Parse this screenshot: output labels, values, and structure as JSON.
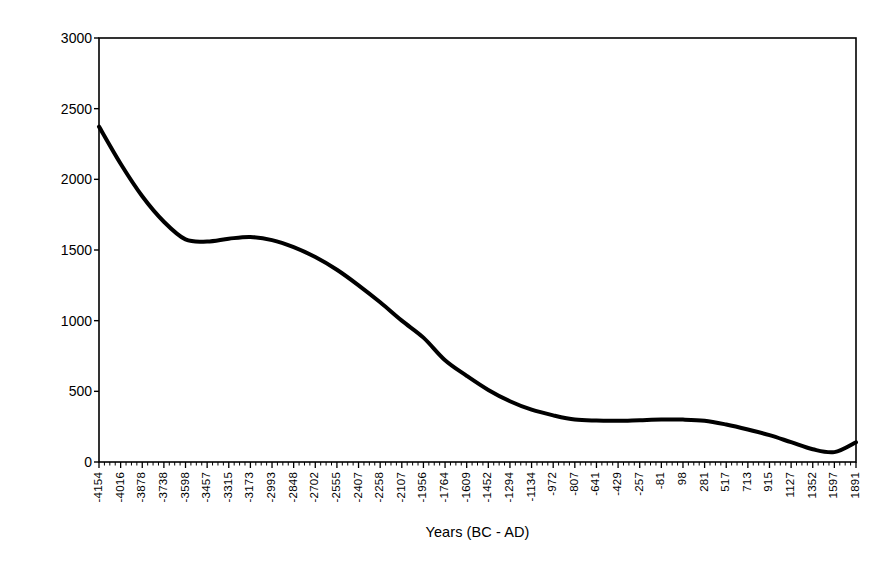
{
  "chart_data": {
    "type": "line",
    "title": "",
    "xlabel": "Years (BC - AD)",
    "ylabel": "Plantago Pollen Count",
    "ylim": [
      0,
      3000
    ],
    "ytick_labels": [
      "0",
      "500",
      "1000",
      "1500",
      "2000",
      "2500",
      "3000"
    ],
    "ytick_values": [
      0,
      500,
      1000,
      1500,
      2000,
      2500,
      3000
    ],
    "grid": false,
    "legend": "none",
    "frame": "full-box",
    "line_color": "#000000",
    "line_width": 4,
    "x_tick_labels": [
      "-4154",
      "-4016",
      "-3878",
      "-3738",
      "-3598",
      "-3457",
      "-3315",
      "-3173",
      "-2993",
      "-2848",
      "-2702",
      "-2555",
      "-2407",
      "-2258",
      "-2107",
      "-1956",
      "-1764",
      "-1609",
      "-1452",
      "-1294",
      "-1134",
      "-972",
      "-807",
      "-641",
      "-429",
      "-257",
      "-81",
      "98",
      "281",
      "517",
      "713",
      "915",
      "1127",
      "1352",
      "1597",
      "1891"
    ],
    "x": [
      -4154,
      -4016,
      -3878,
      -3738,
      -3598,
      -3457,
      -3315,
      -3173,
      -2993,
      -2848,
      -2702,
      -2555,
      -2407,
      -2258,
      -2107,
      -1956,
      -1764,
      -1609,
      -1452,
      -1294,
      -1134,
      -972,
      -807,
      -641,
      -429,
      -257,
      -81,
      98,
      281,
      517,
      713,
      915,
      1127,
      1352,
      1597,
      1891
    ],
    "values": [
      2373,
      2110,
      1880,
      1700,
      1575,
      1560,
      1580,
      1592,
      1570,
      1520,
      1450,
      1360,
      1250,
      1130,
      1000,
      880,
      720,
      610,
      510,
      430,
      370,
      330,
      300,
      293,
      292,
      296,
      300,
      300,
      292,
      265,
      230,
      190,
      140,
      90,
      70,
      140
    ]
  }
}
